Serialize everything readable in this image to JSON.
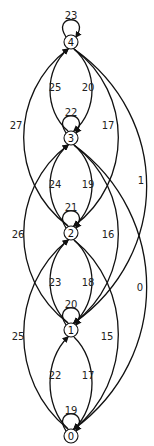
{
  "diagram": {
    "type": "state-transition-graph",
    "nodes": [
      {
        "id": "0",
        "label": "0",
        "x": 71,
        "y": 436,
        "self_loop_label": "19",
        "loop_label_y": 410
      },
      {
        "id": "1",
        "label": "1",
        "x": 71,
        "y": 330,
        "self_loop_label": "20",
        "loop_label_y": 304
      },
      {
        "id": "2",
        "label": "2",
        "x": 71,
        "y": 233,
        "self_loop_label": "21",
        "loop_label_y": 207
      },
      {
        "id": "3",
        "label": "3",
        "x": 71,
        "y": 138,
        "self_loop_label": "22",
        "loop_label_y": 112
      },
      {
        "id": "4",
        "label": "4",
        "x": 71,
        "y": 42,
        "self_loop_label": "23",
        "loop_label_y": 15
      }
    ],
    "edges": [
      {
        "from": "3",
        "to": "4",
        "label": "25",
        "lx": 55,
        "ly": 87
      },
      {
        "from": "4",
        "to": "3",
        "label": "20",
        "lx": 88,
        "ly": 87
      },
      {
        "from": "2",
        "to": "4",
        "label": "27",
        "lx": 16,
        "ly": 125
      },
      {
        "from": "4",
        "to": "2",
        "label": "17",
        "lx": 108,
        "ly": 125
      },
      {
        "from": "4",
        "to": "1",
        "label": "1",
        "lx": 141,
        "ly": 180
      },
      {
        "from": "2",
        "to": "3",
        "label": "24",
        "lx": 55,
        "ly": 184
      },
      {
        "from": "3",
        "to": "2",
        "label": "19",
        "lx": 88,
        "ly": 184
      },
      {
        "from": "1",
        "to": "3",
        "label": "26",
        "lx": 18,
        "ly": 234
      },
      {
        "from": "3",
        "to": "1",
        "label": "16",
        "lx": 108,
        "ly": 234
      },
      {
        "from": "3",
        "to": "0",
        "label": "0",
        "lx": 140,
        "ly": 287
      },
      {
        "from": "1",
        "to": "2",
        "label": "23",
        "lx": 55,
        "ly": 282
      },
      {
        "from": "2",
        "to": "1",
        "label": "18",
        "lx": 88,
        "ly": 282
      },
      {
        "from": "0",
        "to": "2",
        "label": "25",
        "lx": 18,
        "ly": 336
      },
      {
        "from": "2",
        "to": "0",
        "label": "15",
        "lx": 107,
        "ly": 336
      },
      {
        "from": "0",
        "to": "1",
        "label": "22",
        "lx": 55,
        "ly": 375
      },
      {
        "from": "1",
        "to": "0",
        "label": "17",
        "lx": 88,
        "ly": 375
      }
    ]
  }
}
